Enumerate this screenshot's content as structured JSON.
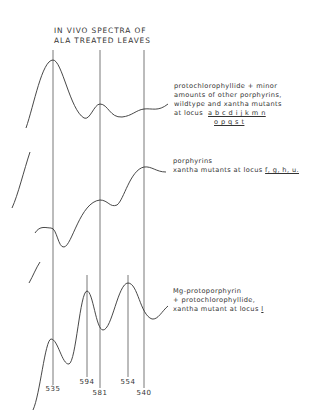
{
  "title": {
    "line1": "IN VIVO SPECTRA OF",
    "line2": "ALA TREATED LEAVES"
  },
  "spectra": [
    {
      "name": "top",
      "label_lines": [
        "protochlorophyllide + minor",
        "amounts of other porphyrins,",
        "wildtype  and  xantha mutants",
        "at locus"
      ],
      "loci_row1": "a b c d i j k m n",
      "loci_row2": "o p q s t"
    },
    {
      "name": "middle",
      "label_lines": [
        "porphyrins",
        "xantha mutants at locus"
      ],
      "loci": "f, g, h, u."
    },
    {
      "name": "bottom",
      "label_lines": [
        "Mg-protoporphyrin",
        "+ protochlorophyllide,",
        "xantha mutant at locus"
      ],
      "loci": "l"
    }
  ],
  "wavelengths": [
    {
      "value": "535",
      "x": 53,
      "y": 391
    },
    {
      "value": "594",
      "x": 87,
      "y": 382
    },
    {
      "value": "581",
      "x": 100,
      "y": 393
    },
    {
      "value": "554",
      "x": 128,
      "y": 382
    },
    {
      "value": "540",
      "x": 144,
      "y": 393
    }
  ]
}
